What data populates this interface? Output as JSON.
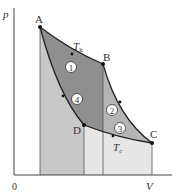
{
  "diagram": {
    "type": "pV-diagram Carnot cycle",
    "axes": {
      "y_label": "p",
      "x_label": "V",
      "origin_label": "0"
    },
    "points": [
      {
        "label": "A",
        "x": 40,
        "y": 27
      },
      {
        "label": "B",
        "x": 103,
        "y": 64
      },
      {
        "label": "C",
        "x": 152,
        "y": 143
      },
      {
        "label": "D",
        "x": 84,
        "y": 125
      }
    ],
    "isotherms": {
      "hot": "T",
      "hot_sub": "h",
      "cold": "T",
      "cold_sub": "c"
    },
    "regions": [
      "1",
      "2",
      "3",
      "4"
    ],
    "colors": {
      "dark_region": "#8c8c8c",
      "mid_region": "#b3b3b3",
      "light_region": "#d9d9d9",
      "lighter_region": "#e8e8e8",
      "line": "#222222"
    }
  }
}
